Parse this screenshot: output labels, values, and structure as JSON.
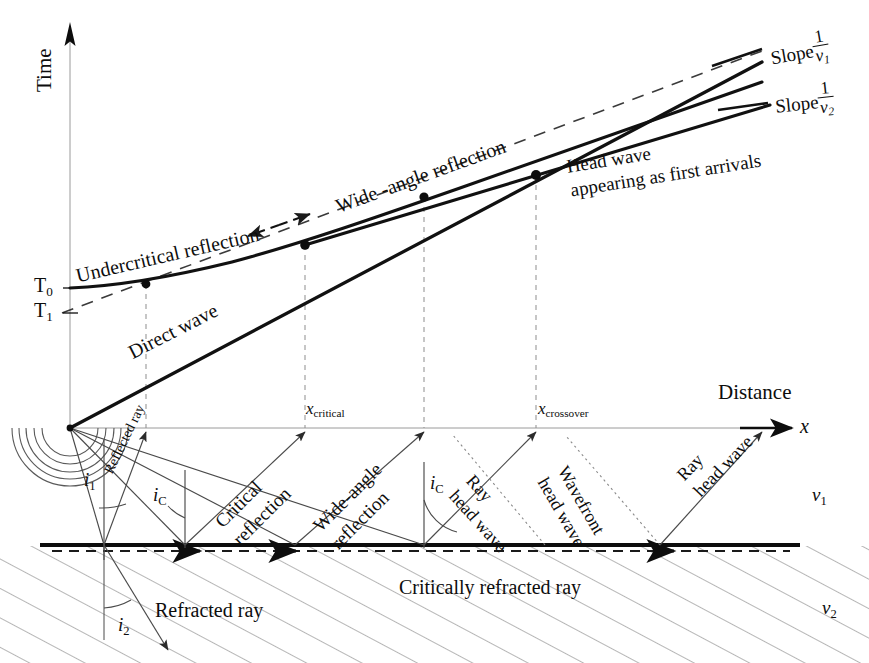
{
  "figure": {
    "kind": "seismic-refraction-traveltime-diagram"
  },
  "axes": {
    "y_axis_label": "Time",
    "x_axis_label": "Distance",
    "x_axis_symbol": "x",
    "time_ticks": [
      {
        "id": "T0",
        "base": "T",
        "sub": "0",
        "y_px": 288
      },
      {
        "id": "T1",
        "base": "T",
        "sub": "1",
        "y_px": 313
      }
    ],
    "x_markers": [
      {
        "id": "x-critical",
        "base": "x",
        "sub": "critical",
        "x_px": 305
      },
      {
        "id": "x-crossover",
        "base": "x",
        "sub": "crossover",
        "x_px": 536
      }
    ]
  },
  "traveltime_curves": [
    {
      "name": "undercritical-reflection",
      "label": "Undercritical reflection"
    },
    {
      "name": "wide-angle-reflection",
      "label": "Wide -angle reflection"
    },
    {
      "name": "direct-wave",
      "label": "Direct wave"
    },
    {
      "name": "head-wave",
      "label_line1": "Head wave",
      "label_line2": "appearing as first arrivals"
    }
  ],
  "slope_labels": [
    {
      "id": "slope-v1",
      "word": "Slope",
      "numerator": "1",
      "denominator": "v",
      "denominator_sub": "1"
    },
    {
      "id": "slope-v2",
      "word": "Slope",
      "numerator": "1",
      "denominator": "v",
      "denominator_sub": "2"
    }
  ],
  "raypath_labels": {
    "reflected_ray": "Reflected ray",
    "critical_reflection_line1": "Critical",
    "critical_reflection_line2": "reflection",
    "wide_angle_reflection_line1": "Wide-angle",
    "wide_angle_reflection_line2": "reflection",
    "ray_head_wave_line1": "Ray",
    "ray_head_wave_line2": "head wave",
    "wavefront_head_wave_line1": "Wavefront",
    "wavefront_head_wave_line2": "head wave",
    "ray_head_wave_right_line1": "Ray",
    "ray_head_wave_right_line2": "head wave",
    "refracted_ray": "Refracted ray",
    "critically_refracted_ray": "Critically refracted ray"
  },
  "angle_labels": [
    {
      "id": "i1",
      "base": "i",
      "sub": "1"
    },
    {
      "id": "ic-left",
      "base": "i",
      "sub": "C"
    },
    {
      "id": "ic-mid",
      "base": "i",
      "sub": "C"
    },
    {
      "id": "i2",
      "base": "i",
      "sub": "2"
    }
  ],
  "velocity_labels": [
    {
      "id": "v1",
      "base": "v",
      "sub": "1",
      "layer": "upper"
    },
    {
      "id": "v2",
      "base": "v",
      "sub": "2",
      "layer": "lower"
    }
  ],
  "geometry": {
    "source_px": {
      "x": 70,
      "y": 428
    },
    "interface_y_px": 545,
    "surface_y_px": 428,
    "time_axis_x_px": 70,
    "critical_point_px": {
      "x": 305,
      "y": 245
    },
    "crossover_point_px": {
      "x": 536,
      "y": 175
    },
    "undercritical_dot_px": {
      "x": 146,
      "y": 284
    },
    "wideangle_dot_px": {
      "x": 424,
      "y": 197
    }
  },
  "colors": {
    "ink": "#0d0d0d",
    "thin_ray": "#4a4a4a",
    "dashed_guide": "#5a5a5a",
    "hatch": "#6b6b6b",
    "background": "#ffffff"
  }
}
